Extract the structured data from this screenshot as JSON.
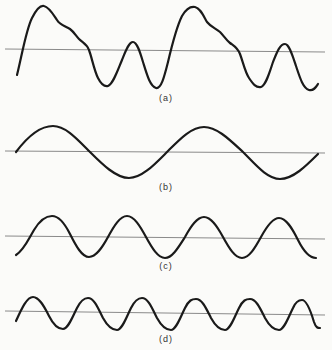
{
  "figure": {
    "panels": [
      {
        "id": "a",
        "label": "(a)",
        "description": "Complex periodic waveform (sum of harmonics), two periods shown",
        "axis_y": 50,
        "label_pos": {
          "x": 166,
          "y": 93
        },
        "path": "M17,75 C22,55 26,30 32,18 C36,10 40,5 44,6 C49,7 53,14 57,20 C60,25 65,26 70,29 C74,32 76,36 79,39 C83,43 87,44 89,50 C92,58 94,70 98,78 C101,84 104,87 108,86 C113,84 117,72 122,60 C126,50 129,42 133,42 C137,42 140,52 143,62 C147,75 150,86 156,88 C161,89 164,78 168,62 C172,45 176,28 182,16 C186,9 190,6 195,7 C200,8 203,15 207,22 C211,27 215,28 220,32 C224,36 226,40 230,43 C234,46 237,47 240,54 C243,62 245,72 249,78 C253,84 256,88 261,87 C266,85 269,74 273,62 C277,52 280,44 285,44 C289,44 292,54 296,66 C300,78 303,88 309,90 C314,91 316,87 318,84"
      },
      {
        "id": "b",
        "label": "(b)",
        "description": "Fundamental sine wave, two periods",
        "axis_y": 152,
        "label_pos": {
          "x": 166,
          "y": 182
        },
        "path": "M16,152 C28,136 40,126 53,126 C66,126 78,140 90,152 C102,164 116,178 129,178 C142,178 155,164 167,152 C179,140 191,127 204,127 C217,127 230,140 243,152 C255,164 267,179 280,179 C293,179 306,166 318,154"
      },
      {
        "id": "c",
        "label": "(c)",
        "description": "Second harmonic sine wave, four periods",
        "axis_y": 237,
        "label_pos": {
          "x": 166,
          "y": 261
        },
        "path": "M16,255 C24,250 28,240 34,230 C40,220 46,216 52,216 C58,216 64,222 70,234 C76,246 82,257 89,257 C96,257 102,248 108,237 C114,226 120,216 127,216 C134,216 140,226 146,237 C152,248 158,258 165,258 C172,258 178,248 185,237 C191,226 197,217 204,217 C211,217 217,226 223,237 C229,248 235,258 242,258 C249,258 255,248 261,237 C267,226 273,218 279,218 C286,218 292,228 298,240 C304,252 310,258 316,258"
      },
      {
        "id": "d",
        "label": "(d)",
        "description": "Third harmonic sine wave, six periods",
        "axis_y": 312,
        "label_pos": {
          "x": 166,
          "y": 334
        },
        "path": "M16,321 C22,308 27,297 33,297 C39,297 44,306 49,316 C54,326 58,329 63,329 C68,329 72,318 77,308 C81,300 84,298 88,298 C94,298 98,308 103,318 C108,327 112,330 117,330 C122,330 126,318 131,308 C135,300 138,298 142,298 C148,298 152,308 157,318 C162,327 166,330 171,330 C176,330 180,318 185,308 C189,300 192,299 196,299 C202,299 206,308 211,318 C216,327 220,330 225,330 C230,330 234,318 239,308 C243,300 246,299 250,299 C256,299 260,308 265,318 C270,327 274,330 279,330 C284,330 288,318 293,308 C296,301 299,300 302,300 C307,300 311,312 314,322 C316,328 318,328 320,328"
      }
    ],
    "axis_x_start": 5,
    "axis_x_end": 325,
    "colors": {
      "background": "#fbfbf9",
      "wave": "#1a1a1a",
      "axis": "#8a8a8a"
    }
  }
}
